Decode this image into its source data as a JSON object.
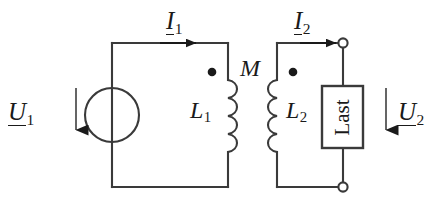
{
  "figure": {
    "kind": "circuit-diagram",
    "background_color": "#ffffff",
    "line_color": "#3a3a3a",
    "text_color": "#1a1a1a"
  },
  "labels": {
    "source_voltage": {
      "base": "U",
      "sub": "1",
      "underlined": true
    },
    "load_voltage": {
      "base": "U",
      "sub": "2",
      "underlined": true
    },
    "primary_current": {
      "base": "I",
      "sub": "1",
      "underlined": true
    },
    "secondary_current": {
      "base": "I",
      "sub": "2",
      "underlined": true
    },
    "primary_inductance": {
      "base": "L",
      "sub": "1",
      "underlined": false
    },
    "secondary_inductance": {
      "base": "L",
      "sub": "2",
      "underlined": false
    },
    "mutual_inductance": {
      "base": "M",
      "sub": "",
      "underlined": false
    },
    "load_box": "Last"
  },
  "components": {
    "source": {
      "type": "circle-source-symbol",
      "cx": 112,
      "cy": 115,
      "r": 27
    },
    "coil_primary": {
      "type": "inductor",
      "bumps": 4,
      "x": 228,
      "y_top": 80,
      "y_bottom": 152,
      "bump_side": "right",
      "dot_side": "left"
    },
    "coil_secondary": {
      "type": "inductor",
      "bumps": 4,
      "x": 277,
      "y_top": 80,
      "y_bottom": 152,
      "bump_side": "left",
      "dot_side": "right"
    },
    "load": {
      "type": "rectangle-box",
      "x": 322,
      "y": 86,
      "width": 41,
      "height": 62
    }
  },
  "markers": {
    "coupling_dot_primary": {
      "cx": 212,
      "cy": 72,
      "r": 4.2
    },
    "coupling_dot_secondary": {
      "cx": 293,
      "cy": 72,
      "r": 4.2
    },
    "terminal_top_right": {
      "cx": 343,
      "cy": 43,
      "r": 4.6,
      "style": "open"
    },
    "terminal_bottom_right": {
      "cx": 343,
      "cy": 187,
      "r": 4.6,
      "style": "open"
    }
  },
  "arrows": {
    "current_primary": {
      "direction": "right",
      "x_from": 160,
      "x_to": 196,
      "y": 43
    },
    "current_secondary": {
      "direction": "right",
      "x_from": 300,
      "x_to": 336,
      "y": 43
    },
    "voltage_primary": {
      "direction": "down",
      "x": 76,
      "y_from": 88,
      "y_to": 143
    },
    "voltage_secondary": {
      "direction": "down",
      "x": 386,
      "y_from": 88,
      "y_to": 143
    }
  },
  "wires": {
    "primary_top": {
      "x1": 112,
      "y1": 43,
      "x2": 228,
      "y2": 43
    },
    "primary_left": {
      "x1": 112,
      "y1": 43,
      "x2": 112,
      "y2": 187
    },
    "primary_bottom": {
      "x1": 112,
      "y1": 187,
      "x2": 228,
      "y2": 187
    },
    "primary_right_upper": {
      "x1": 228,
      "y1": 43,
      "x2": 228,
      "y2": 80
    },
    "primary_right_lower": {
      "x1": 228,
      "y1": 152,
      "x2": 228,
      "y2": 187
    },
    "secondary_left_upper": {
      "x1": 277,
      "y1": 43,
      "x2": 277,
      "y2": 80
    },
    "secondary_left_lower": {
      "x1": 277,
      "y1": 152,
      "x2": 277,
      "y2": 187
    },
    "secondary_top": {
      "x1": 277,
      "y1": 43,
      "x2": 343,
      "y2": 43
    },
    "secondary_bottom": {
      "x1": 277,
      "y1": 187,
      "x2": 343,
      "y2": 187
    },
    "load_top_lead": {
      "x1": 343,
      "y1": 43,
      "x2": 343,
      "y2": 86
    },
    "load_bottom_lead": {
      "x1": 343,
      "y1": 148,
      "x2": 343,
      "y2": 187
    }
  }
}
